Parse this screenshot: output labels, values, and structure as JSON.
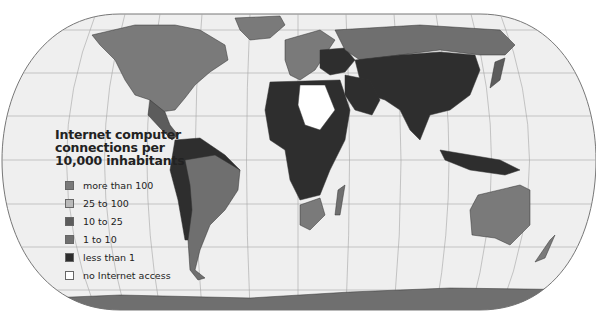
{
  "map": {
    "projection": "world pseudo-cylindrical (rounded) projection with graticule",
    "background_color": "#efefef",
    "graticule_color": "#9a9a9a"
  },
  "legend": {
    "title_line1": "Internet computer",
    "title_line2": "connections per",
    "title_line3": "10,000 inhabitants",
    "items": [
      {
        "label": "more than 100",
        "color": "#7a7a7a"
      },
      {
        "label": "25 to 100",
        "color": "#b9b9b9"
      },
      {
        "label": "10 to  25",
        "color": "#5c5c5c"
      },
      {
        "label": "1 to 10",
        "color": "#6f6f6f"
      },
      {
        "label": "less than 1",
        "color": "#2e2e2e"
      },
      {
        "label": "no Internet access",
        "color": "#ffffff"
      }
    ]
  }
}
